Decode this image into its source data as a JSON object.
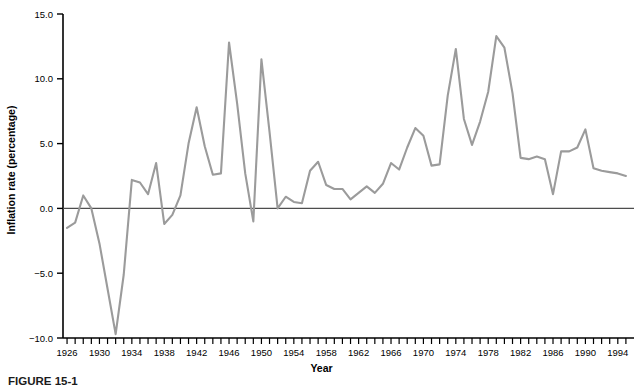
{
  "figure": {
    "caption": "FIGURE 15-1",
    "background_color": "#ffffff"
  },
  "chart_data": {
    "type": "line",
    "title": "",
    "subtitle": "",
    "xlabel": "Year",
    "ylabel": "Inflation rate (percentage)",
    "xlim": [
      1925.5,
      1996
    ],
    "ylim": [
      -10.0,
      15.0
    ],
    "grid": false,
    "legend": null,
    "line_color": "#9b9b9b",
    "axis_color": "#000000",
    "zero_line_color": "#4d4d4d",
    "x_tick_interval": 1,
    "x_label_interval": 4,
    "y_ticks": [
      -10.0,
      -5.0,
      0.0,
      5.0,
      10.0,
      15.0
    ],
    "y_tick_labels": [
      "-10.0",
      "-5.0",
      "0.0",
      "5.0",
      "10.0",
      "15.0"
    ],
    "x_ticks": [
      1926,
      1927,
      1928,
      1929,
      1930,
      1931,
      1932,
      1933,
      1934,
      1935,
      1936,
      1937,
      1938,
      1939,
      1940,
      1941,
      1942,
      1943,
      1944,
      1945,
      1946,
      1947,
      1948,
      1949,
      1950,
      1951,
      1952,
      1953,
      1954,
      1955,
      1956,
      1957,
      1958,
      1959,
      1960,
      1961,
      1962,
      1963,
      1964,
      1965,
      1966,
      1967,
      1968,
      1969,
      1970,
      1971,
      1972,
      1973,
      1974,
      1975,
      1976,
      1977,
      1978,
      1979,
      1980,
      1981,
      1982,
      1983,
      1984,
      1985,
      1986,
      1987,
      1988,
      1989,
      1990,
      1991,
      1992,
      1993,
      1994,
      1995
    ],
    "x_tick_labels": [
      "1926",
      "1930",
      "1934",
      "1938",
      "1942",
      "1946",
      "1950",
      "1954",
      "1958",
      "1962",
      "1966",
      "1970",
      "1974",
      "1978",
      "1982",
      "1986",
      "1990",
      "1994"
    ],
    "series": [
      {
        "name": "Inflation rate",
        "x": [
          1926,
          1927,
          1928,
          1929,
          1930,
          1931,
          1932,
          1933,
          1934,
          1935,
          1936,
          1937,
          1938,
          1939,
          1940,
          1941,
          1942,
          1943,
          1944,
          1945,
          1946,
          1947,
          1948,
          1949,
          1950,
          1951,
          1952,
          1953,
          1954,
          1955,
          1956,
          1957,
          1958,
          1959,
          1960,
          1961,
          1962,
          1963,
          1964,
          1965,
          1966,
          1967,
          1968,
          1969,
          1970,
          1971,
          1972,
          1973,
          1974,
          1975,
          1976,
          1977,
          1978,
          1979,
          1980,
          1981,
          1982,
          1983,
          1984,
          1985,
          1986,
          1987,
          1988,
          1989,
          1990,
          1991,
          1992,
          1993,
          1994,
          1995
        ],
        "values": [
          -1.5,
          -1.1,
          1.0,
          0.0,
          -2.7,
          -6.2,
          -9.7,
          -5.1,
          2.2,
          2.0,
          1.1,
          3.5,
          -1.2,
          -0.5,
          1.0,
          5.0,
          7.8,
          4.8,
          2.6,
          2.7,
          12.8,
          8.1,
          2.7,
          -1.0,
          11.5,
          5.9,
          0.0,
          0.9,
          0.5,
          0.4,
          2.9,
          3.6,
          1.8,
          1.5,
          1.5,
          0.7,
          1.2,
          1.7,
          1.2,
          1.9,
          3.5,
          3.0,
          4.7,
          6.2,
          5.6,
          3.3,
          3.4,
          8.7,
          12.3,
          6.9,
          4.9,
          6.7,
          9.0,
          13.3,
          12.4,
          8.9,
          3.9,
          3.8,
          4.0,
          3.8,
          1.1,
          4.4,
          4.4,
          4.7,
          6.1,
          3.1,
          2.9,
          2.8,
          2.7,
          2.5
        ]
      }
    ]
  }
}
